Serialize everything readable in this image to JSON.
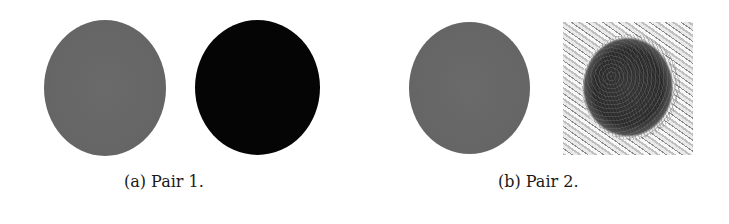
{
  "figure": {
    "subfigures": [
      {
        "label": "(a)",
        "caption": "(a) Pair 1.",
        "images": [
          {
            "kind": "gray-disc",
            "color": "#666666"
          },
          {
            "kind": "black-disc",
            "color": "#050505"
          }
        ]
      },
      {
        "label": "(b)",
        "caption": "(b) Pair 2.",
        "images": [
          {
            "kind": "gray-disc",
            "color": "#666666"
          },
          {
            "kind": "textured-square-with-dark-disc",
            "color": "#333333"
          }
        ]
      }
    ]
  }
}
